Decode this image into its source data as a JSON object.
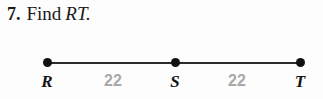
{
  "problem": {
    "number": "7.",
    "prompt": "Find",
    "segment": "RT."
  },
  "figure": {
    "points": [
      {
        "label": "R",
        "name": "point-r"
      },
      {
        "label": "S",
        "name": "point-s"
      },
      {
        "label": "T",
        "name": "point-t"
      }
    ],
    "measures": [
      {
        "value": "22",
        "between": "R-S"
      },
      {
        "value": "22",
        "between": "S-T"
      }
    ]
  },
  "colors": {
    "background": "#fdfdfd",
    "ink": "#141414",
    "line": "#2b2b2b",
    "measure_gray": "#a8a8a8"
  }
}
